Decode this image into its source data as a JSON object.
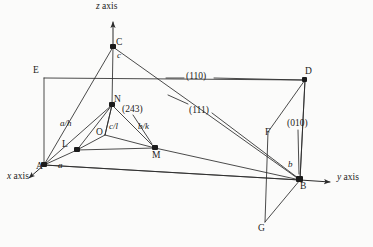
{
  "figure": {
    "background_color": "#fbfbfa",
    "line_color": "#2b2b2b",
    "text_color": "#1b1b1b"
  },
  "axes": [
    {
      "id": "x",
      "label": "x axis",
      "italic_part": "x",
      "rest": " axis"
    },
    {
      "id": "y",
      "label": "y axis",
      "italic_part": "y",
      "rest": " axis"
    },
    {
      "id": "z",
      "label": "z axis",
      "italic_part": "z",
      "rest": " axis"
    }
  ],
  "vertices": [
    {
      "name": "A",
      "label": "A",
      "x": 44,
      "y": 165,
      "dot": true
    },
    {
      "name": "B",
      "label": "B",
      "x": 300,
      "y": 180,
      "dot": true
    },
    {
      "name": "C",
      "label": "C",
      "x": 113,
      "y": 47,
      "dot": true
    },
    {
      "name": "D",
      "label": "D",
      "x": 305,
      "y": 80,
      "dot": true
    },
    {
      "name": "E",
      "label": "E",
      "x": 44,
      "y": 78,
      "dot": false
    },
    {
      "name": "F",
      "label": "F",
      "x": 268,
      "y": 132,
      "dot": false
    },
    {
      "name": "G",
      "label": "G",
      "x": 265,
      "y": 222,
      "dot": false
    },
    {
      "name": "L",
      "label": "L",
      "x": 77,
      "y": 150,
      "dot": true
    },
    {
      "name": "M",
      "label": "M",
      "x": 155,
      "y": 148,
      "dot": true
    },
    {
      "name": "N",
      "label": "N",
      "x": 112,
      "y": 105,
      "dot": true
    },
    {
      "name": "O",
      "label": "O",
      "x": 105,
      "y": 135,
      "dot": false
    }
  ],
  "intercept_labels": [
    {
      "name": "a",
      "text": "a",
      "x": 59,
      "y": 162
    },
    {
      "name": "b",
      "text": "b",
      "x": 290,
      "y": 163
    },
    {
      "name": "c",
      "text": "c",
      "x": 117,
      "y": 52
    },
    {
      "name": "a-over-h",
      "text": "a/h",
      "x": 61,
      "y": 121
    },
    {
      "name": "b-over-k",
      "text": "b/k",
      "x": 140,
      "y": 124
    },
    {
      "name": "c-over-l",
      "text": "c/l",
      "x": 110,
      "y": 124
    }
  ],
  "miller_indices": [
    {
      "name": "plane-110",
      "text": "(110)",
      "x": 188,
      "y": 74
    },
    {
      "name": "plane-111",
      "text": "(111)",
      "x": 190,
      "y": 108
    },
    {
      "name": "plane-010",
      "text": "(010)",
      "x": 288,
      "y": 122
    },
    {
      "name": "plane-243",
      "text": "(243)",
      "x": 123,
      "y": 107
    }
  ],
  "axis_labels": [
    {
      "name": "x-axis-label",
      "x": 8,
      "y": 178
    },
    {
      "name": "y-axis-label",
      "x": 338,
      "y": 175
    },
    {
      "name": "z-axis-label",
      "x": 98,
      "y": 3
    }
  ],
  "geometry": {
    "origin_A": [
      44,
      165
    ],
    "axis_x_tip": [
      28,
      179
    ],
    "axis_y_tip": [
      332,
      182
    ],
    "axis_z_tip": [
      113,
      20
    ],
    "plane_110_quad": [
      [
        44,
        78
      ],
      [
        305,
        80
      ],
      [
        300,
        180
      ],
      [
        44,
        165
      ]
    ],
    "plane_010_quad": [
      [
        268,
        132
      ],
      [
        305,
        80
      ],
      [
        300,
        180
      ],
      [
        265,
        222
      ]
    ],
    "plane_111_tri": [
      [
        44,
        165
      ],
      [
        300,
        180
      ],
      [
        113,
        47
      ]
    ],
    "plane_243_tri": [
      [
        77,
        150
      ],
      [
        155,
        148
      ],
      [
        112,
        105
      ]
    ],
    "leader_110": [
      [
        166,
        74
      ],
      [
        188,
        74
      ],
      [
        216,
        74
      ],
      [
        303,
        80
      ]
    ],
    "leader_111": [
      [
        190,
        110
      ],
      [
        212,
        113
      ]
    ],
    "leader_243": [
      [
        131,
        112
      ],
      [
        150,
        143
      ]
    ]
  }
}
